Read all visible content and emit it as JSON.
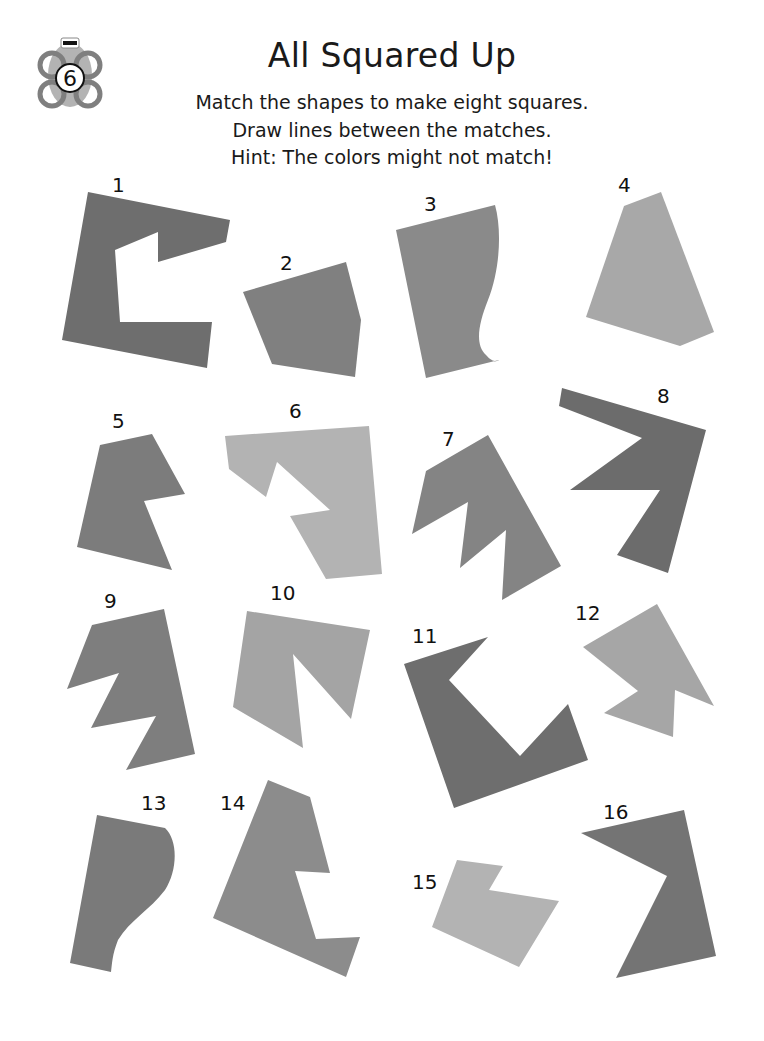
{
  "page": {
    "badge_number": "6",
    "title": "All Squared Up",
    "instructions": [
      "Match the shapes to make eight squares.",
      "Draw lines between the matches.",
      "Hint: The colors might not match!"
    ]
  },
  "colors": {
    "dark_gray": "#6e6e6e",
    "mid_gray": "#8a8a8a",
    "light_gray": "#a8a8a8",
    "lighter_gray": "#b5b5b5",
    "text": "#111111"
  },
  "shapes": [
    {
      "id": 1,
      "label": "1"
    },
    {
      "id": 2,
      "label": "2"
    },
    {
      "id": 3,
      "label": "3"
    },
    {
      "id": 4,
      "label": "4"
    },
    {
      "id": 5,
      "label": "5"
    },
    {
      "id": 6,
      "label": "6"
    },
    {
      "id": 7,
      "label": "7"
    },
    {
      "id": 8,
      "label": "8"
    },
    {
      "id": 9,
      "label": "9"
    },
    {
      "id": 10,
      "label": "10"
    },
    {
      "id": 11,
      "label": "11"
    },
    {
      "id": 12,
      "label": "12"
    },
    {
      "id": 13,
      "label": "13"
    },
    {
      "id": 14,
      "label": "14"
    },
    {
      "id": 15,
      "label": "15"
    },
    {
      "id": 16,
      "label": "16"
    }
  ]
}
